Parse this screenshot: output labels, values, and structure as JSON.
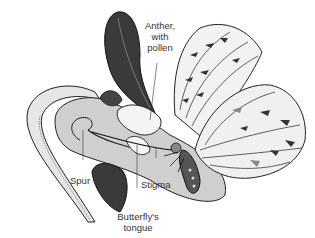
{
  "diagram": {
    "labels": {
      "anther_line1": "Anther,",
      "anther_line2": "with",
      "anther_line3": "pollen",
      "spur": "Spur",
      "stigma": "Stigma",
      "tongue_line1": "Butterfly's",
      "tongue_line2": "tongue"
    },
    "colors": {
      "background": "#ffffff",
      "ink": "#222222",
      "flower_fill": "#cfcfcf",
      "dark_petal": "#3a3a3a",
      "label_text": "#333333"
    }
  }
}
